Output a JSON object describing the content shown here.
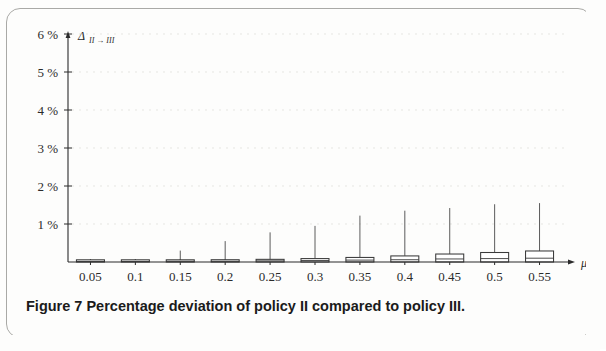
{
  "figure": {
    "caption_label": "Figure 7",
    "caption_text": "Percentage deviation of policy II compared to policy III."
  },
  "chart_data": {
    "type": "box",
    "title": "",
    "xlabel": "μ",
    "ylabel": "Δ",
    "ylabel_sub": "II → III",
    "xlabel_axis_symbol": "μ",
    "grid": true,
    "legend": "none",
    "xlim": [
      0.025,
      0.575
    ],
    "ylim": [
      0,
      6.4
    ],
    "ytick_labels": [
      "6 %",
      "5 %",
      "4 %",
      "3 %",
      "2 %",
      "1 %"
    ],
    "ytick_values": [
      6,
      5,
      4,
      3,
      2,
      1
    ],
    "xtick_labels": [
      "0.05",
      "0.1",
      "0.15",
      "0.2",
      "0.25",
      "0.3",
      "0.35",
      "0.4",
      "0.45",
      "0.5",
      "0.55"
    ],
    "categories": [
      0.05,
      0.1,
      0.15,
      0.2,
      0.25,
      0.3,
      0.35,
      0.4,
      0.45,
      0.5,
      0.55
    ],
    "units": "percent",
    "boxes": [
      {
        "x": 0.05,
        "q1": 0.0,
        "median": 0.01,
        "q3": 0.03,
        "whisker_low": 0.0,
        "whisker_high": 0.05
      },
      {
        "x": 0.1,
        "q1": 0.0,
        "median": 0.01,
        "q3": 0.04,
        "whisker_low": 0.0,
        "whisker_high": 0.07
      },
      {
        "x": 0.15,
        "q1": 0.0,
        "median": 0.02,
        "q3": 0.05,
        "whisker_low": 0.0,
        "whisker_high": 0.3
      },
      {
        "x": 0.2,
        "q1": 0.0,
        "median": 0.02,
        "q3": 0.06,
        "whisker_low": 0.0,
        "whisker_high": 0.55
      },
      {
        "x": 0.25,
        "q1": 0.0,
        "median": 0.03,
        "q3": 0.07,
        "whisker_low": 0.0,
        "whisker_high": 0.78
      },
      {
        "x": 0.3,
        "q1": 0.0,
        "median": 0.04,
        "q3": 0.09,
        "whisker_low": 0.0,
        "whisker_high": 0.95
      },
      {
        "x": 0.35,
        "q1": 0.0,
        "median": 0.05,
        "q3": 0.12,
        "whisker_low": 0.0,
        "whisker_high": 1.22
      },
      {
        "x": 0.4,
        "q1": 0.0,
        "median": 0.06,
        "q3": 0.16,
        "whisker_low": 0.0,
        "whisker_high": 1.35
      },
      {
        "x": 0.45,
        "q1": 0.0,
        "median": 0.08,
        "q3": 0.21,
        "whisker_low": 0.0,
        "whisker_high": 1.42
      },
      {
        "x": 0.5,
        "q1": 0.0,
        "median": 0.09,
        "q3": 0.25,
        "whisker_low": 0.0,
        "whisker_high": 1.52
      },
      {
        "x": 0.55,
        "q1": 0.0,
        "median": 0.1,
        "q3": 0.29,
        "whisker_low": 0.0,
        "whisker_high": 1.55
      }
    ],
    "colors": {
      "axis": "#2b2b2b",
      "box_stroke": "#3a3a3a",
      "box_fill": "#ffffff",
      "whisker": "#4a4a4a",
      "grid": "#d8d8d4"
    }
  }
}
